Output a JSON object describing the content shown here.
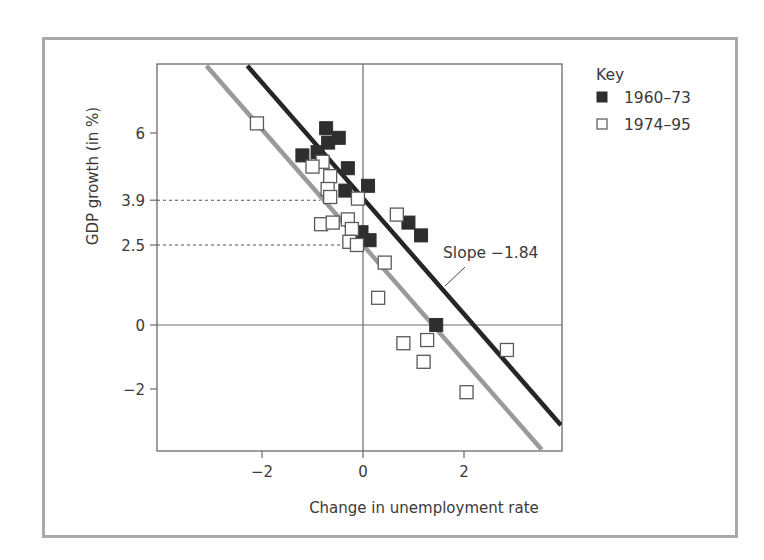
{
  "chart_data": {
    "type": "scatter",
    "title": "",
    "xlabel": "Change in unemployment rate",
    "ylabel": "GDP growth (in %)",
    "xlim": [
      -4.1,
      3.95
    ],
    "ylim": [
      -4.0,
      8.2
    ],
    "grid": false,
    "x_ticks": [
      -2,
      0,
      2
    ],
    "x_tick_labels": [
      "−2",
      "0",
      "2"
    ],
    "y_ticks": [
      -2,
      0,
      2.5,
      3.9,
      6
    ],
    "y_tick_labels": [
      "−2",
      "0",
      "2.5",
      "3.9",
      "6"
    ],
    "reference_lines": [
      {
        "type": "vertical",
        "x": 0
      },
      {
        "type": "horizontal",
        "y": 0
      }
    ],
    "guide_lines": [
      {
        "y": 3.9,
        "x_to": -0.85,
        "style": "dotted"
      },
      {
        "y": 2.5,
        "x_to": -0.4,
        "style": "dotted"
      }
    ],
    "legend": {
      "title": "Key",
      "position": "right",
      "entries": [
        {
          "label": "1960–73",
          "marker": "filled-square",
          "color": "#2e2e2e"
        },
        {
          "label": "1974–95",
          "marker": "open-square",
          "color": "#ffffff"
        }
      ]
    },
    "series": [
      {
        "name": "1960–73",
        "marker": "filled-square",
        "color": "#2e2e2e",
        "points": [
          [
            -0.73,
            6.15
          ],
          [
            -0.48,
            5.85
          ],
          [
            -0.69,
            5.7
          ],
          [
            -1.2,
            5.3
          ],
          [
            -0.9,
            5.4
          ],
          [
            -0.3,
            4.9
          ],
          [
            0.1,
            4.35
          ],
          [
            -0.35,
            4.2
          ],
          [
            0.9,
            3.2
          ],
          [
            1.15,
            2.8
          ],
          [
            -0.03,
            2.9
          ],
          [
            0.13,
            2.65
          ],
          [
            1.45,
            0.0
          ]
        ]
      },
      {
        "name": "1974–95",
        "marker": "open-square",
        "color": "#ffffff",
        "points": [
          [
            -2.1,
            6.3
          ],
          [
            -0.8,
            5.1
          ],
          [
            -1.0,
            4.95
          ],
          [
            -0.65,
            4.65
          ],
          [
            -0.7,
            4.25
          ],
          [
            -0.65,
            4.0
          ],
          [
            -0.1,
            3.95
          ],
          [
            0.67,
            3.45
          ],
          [
            -0.83,
            3.15
          ],
          [
            -0.6,
            3.2
          ],
          [
            -0.3,
            3.3
          ],
          [
            -0.22,
            3.0
          ],
          [
            -0.27,
            2.6
          ],
          [
            -0.12,
            2.5
          ],
          [
            0.43,
            1.95
          ],
          [
            0.3,
            0.85
          ],
          [
            0.8,
            -0.57
          ],
          [
            1.27,
            -0.47
          ],
          [
            1.2,
            -1.15
          ],
          [
            2.85,
            -0.78
          ],
          [
            2.05,
            -2.1
          ]
        ]
      }
    ],
    "fit_lines": [
      {
        "name": "1960–73 fit",
        "color": "#262626",
        "width": 4.5,
        "from": [
          -2.29,
          8.1
        ],
        "to": [
          3.92,
          -3.13
        ]
      },
      {
        "name": "1974–95 fit",
        "color": "#9a9a9a",
        "width": 4.5,
        "from": [
          -3.1,
          8.1
        ],
        "to": [
          3.54,
          -3.9
        ]
      }
    ],
    "annotations": [
      {
        "text": "Slope −1.84",
        "x": 1.6,
        "y": 2.1,
        "points_to": [
          1.6,
          1.1
        ]
      }
    ]
  }
}
